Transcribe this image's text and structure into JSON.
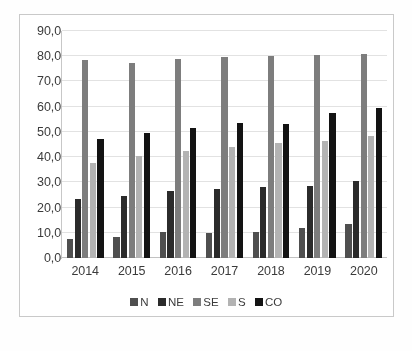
{
  "chart_data": {
    "type": "bar",
    "title": "",
    "subtitle": "",
    "xlabel": "",
    "ylabel": "",
    "categories": [
      "2014",
      "2015",
      "2016",
      "2017",
      "2018",
      "2019",
      "2020"
    ],
    "series": [
      {
        "name": "N",
        "color": "#4f4f4f",
        "values": [
          7.5,
          8.5,
          10.5,
          10.0,
          10.5,
          12.0,
          13.5
        ]
      },
      {
        "name": "NE",
        "color": "#2b2b2b",
        "values": [
          23.5,
          24.5,
          26.5,
          27.5,
          28.0,
          28.5,
          30.5
        ]
      },
      {
        "name": "SE",
        "color": "#7d7d7d",
        "values": [
          78.5,
          77.5,
          79.0,
          79.5,
          80.0,
          80.5,
          81.0
        ]
      },
      {
        "name": "S",
        "color": "#b3b3b3",
        "values": [
          37.5,
          40.5,
          42.5,
          44.0,
          45.5,
          46.5,
          48.5
        ]
      },
      {
        "name": "CO",
        "color": "#131313",
        "values": [
          47.0,
          49.5,
          51.5,
          53.5,
          53.0,
          57.5,
          59.5
        ]
      }
    ],
    "ylim": [
      0.0,
      90.0
    ],
    "ytick_values": [
      0.0,
      10.0,
      20.0,
      30.0,
      40.0,
      50.0,
      60.0,
      70.0,
      80.0,
      90.0
    ],
    "ytick_labels": [
      "0,0",
      "10,0",
      "20,0",
      "30,0",
      "40,0",
      "50,0",
      "60,0",
      "70,0",
      "80,0",
      "90,0"
    ],
    "grid": true,
    "grid_axis": "y",
    "legend_position": "bottom",
    "legend_entries": [
      "N",
      "NE",
      "SE",
      "S",
      "CO"
    ],
    "annotations": [],
    "decimal_separator": ","
  },
  "figure": {
    "border_color": "#c9c9c9",
    "background": "#ffffff",
    "gridline_color": "#e2e2e2",
    "text_color": "#3b3b3b"
  }
}
